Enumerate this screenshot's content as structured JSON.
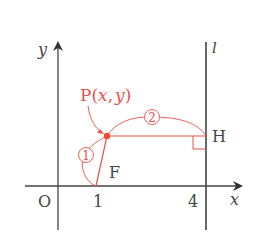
{
  "diagram": {
    "axes": {
      "x_label": "x",
      "y_label": "y",
      "origin_label": "O",
      "ticks": [
        {
          "value": 1,
          "label": "1"
        },
        {
          "value": 4,
          "label": "4"
        }
      ]
    },
    "line": {
      "label": "l",
      "equation": "x = 4"
    },
    "points": {
      "P": {
        "label": "P(x, y)",
        "name": "P",
        "coords": "x, y"
      },
      "F": {
        "label": "F",
        "coords": [
          1,
          0
        ]
      },
      "H": {
        "label": "H"
      }
    },
    "segments": [
      {
        "from": "P",
        "to": "F",
        "mark": "①"
      },
      {
        "from": "P",
        "to": "H",
        "mark": "②"
      }
    ],
    "labels": {
      "mark1": "1",
      "mark2": "2",
      "p_prefix": "P(",
      "p_x": "x",
      "p_comma": ",",
      "p_y": "y",
      "p_suffix": ")"
    },
    "colors": {
      "axis": "#444444",
      "accent": "#e8524a",
      "point": "#f04a2a"
    }
  }
}
